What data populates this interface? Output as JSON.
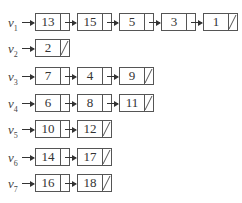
{
  "diagram": {
    "title": "",
    "type": "adjacency-list",
    "lists": [
      {
        "label": "v",
        "sub": "1",
        "nodes": [
          "13",
          "15",
          "5",
          "3",
          "1"
        ]
      },
      {
        "label": "v",
        "sub": "2",
        "nodes": [
          "2"
        ]
      },
      {
        "label": "v",
        "sub": "3",
        "nodes": [
          "7",
          "4",
          "9"
        ]
      },
      {
        "label": "v",
        "sub": "4",
        "nodes": [
          "6",
          "8",
          "11"
        ]
      },
      {
        "label": "v",
        "sub": "5",
        "nodes": [
          "10",
          "12"
        ]
      },
      {
        "label": "v",
        "sub": "6",
        "nodes": [
          "14",
          "17"
        ]
      },
      {
        "label": "v",
        "sub": "7",
        "nodes": [
          "16",
          "18"
        ]
      }
    ],
    "colors": {
      "stroke": "#555555",
      "text": "#333333",
      "background": "#ffffff"
    }
  }
}
